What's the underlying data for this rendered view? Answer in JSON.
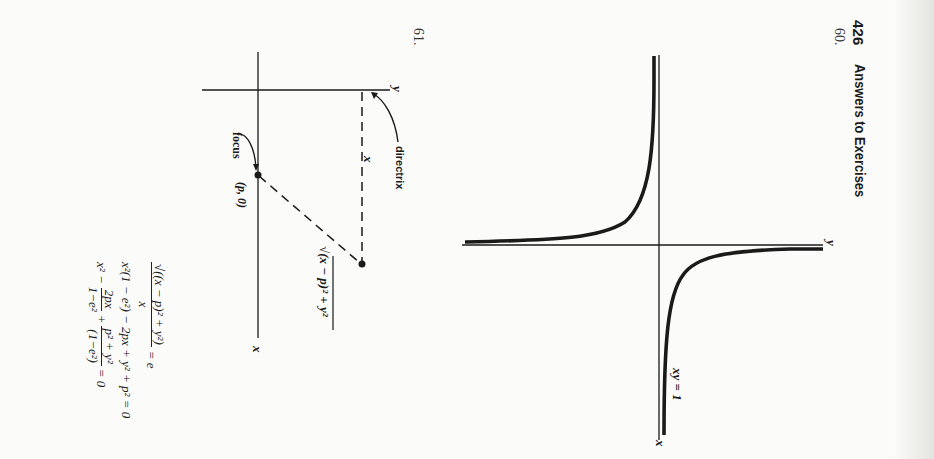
{
  "page": {
    "orientation": "rotated-90-clockwise",
    "header": {
      "page_number": "426",
      "title": "Answers to Exercises"
    }
  },
  "exercise_60": {
    "number": "60.",
    "figure": {
      "curve_label": "xy = 1",
      "x_axis_label": "x",
      "y_axis_label": "y"
    }
  },
  "exercise_61": {
    "number": "61.",
    "figure": {
      "x_axis_label": "x",
      "y_axis_label": "y",
      "directrix_label": "directrix",
      "focus_label": "focus",
      "focus_coords": "(p, 0)",
      "distance_to_directrix_label": "x",
      "distance_to_focus_label": "√(x − p)² + y²"
    },
    "equations": [
      {
        "id": "eq1",
        "numerator": "√((x − p)² + y²)",
        "denominator": "x",
        "rhs": "= e"
      },
      {
        "id": "eq2",
        "text": "x²(1 − e²) − 2px + y² + p² = 0"
      },
      {
        "id": "eq3",
        "lead": "x² −",
        "frac1_num": "2px",
        "frac1_den": "1−e²",
        "plus": "+",
        "frac2_num": "p² + y²",
        "frac2_den": "(1−e²)",
        "rhs": "= 0"
      }
    ]
  },
  "colors": {
    "paper": "#fbfbf9",
    "ink": "#1a1a1a"
  }
}
